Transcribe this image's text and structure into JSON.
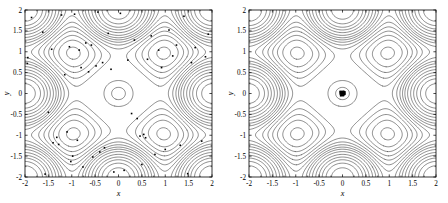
{
  "figure": {
    "panel_count": 2,
    "background_color": "#ffffff",
    "line_color": "#000000",
    "marker_color": "#000000"
  },
  "chart_data": [
    {
      "type": "line",
      "subtype": "contour",
      "panel": "left",
      "title": "",
      "xlabel": "x",
      "ylabel": "y",
      "xlim": [
        -2,
        2
      ],
      "ylim": [
        -2,
        2
      ],
      "xticks": [
        -2,
        -1.5,
        -1,
        -0.5,
        0,
        0.5,
        1,
        1.5,
        2
      ],
      "xticklabels": [
        "-2",
        "-1.5",
        "-1",
        "-0.5",
        "0",
        "0.5",
        "1",
        "1.5",
        "2"
      ],
      "yticks": [
        -2,
        -1.5,
        -1,
        -0.5,
        0,
        0.5,
        1,
        1.5,
        2
      ],
      "yticklabels": [
        "-2",
        "-1.5",
        "-1",
        "-0.5",
        "0",
        "0.5",
        "1",
        "1.5",
        "2"
      ],
      "grid": false,
      "legend": null,
      "contour_levels": 22,
      "field_description": "periodic square-lattice potential with deep central well at origin and secondary wells at integer lattice sites",
      "overlay": {
        "type": "scatter",
        "name": "particles",
        "marker": "square",
        "marker_size": 1.6,
        "count": 60,
        "distribution": "scattered / delocalized across the whole domain",
        "points": [
          [
            -1.94,
            0.86
          ],
          [
            -1.95,
            0.72
          ],
          [
            -1.86,
            1.82
          ],
          [
            -1.57,
            -1.93
          ],
          [
            -1.62,
            1.47
          ],
          [
            -1.5,
            -0.45
          ],
          [
            -1.43,
            1.06
          ],
          [
            -1.4,
            -1.18
          ],
          [
            -1.32,
            -1.05
          ],
          [
            -1.28,
            -1.22
          ],
          [
            -1.22,
            1.88
          ],
          [
            -1.15,
            0.45
          ],
          [
            -1.1,
            -0.92
          ],
          [
            -1.05,
            1.12
          ],
          [
            -1.02,
            -1.63
          ],
          [
            -0.98,
            -1.5
          ],
          [
            -0.94,
            1.9
          ],
          [
            -0.88,
            -1.12
          ],
          [
            -0.84,
            1.04
          ],
          [
            -0.8,
            0.62
          ],
          [
            -0.76,
            -1.76
          ],
          [
            -0.7,
            1.21
          ],
          [
            -0.64,
            0.52
          ],
          [
            -0.58,
            1.16
          ],
          [
            -0.55,
            -1.52
          ],
          [
            -0.48,
            0.66
          ],
          [
            -0.44,
            1.95
          ],
          [
            -0.4,
            -1.4
          ],
          [
            -0.34,
            0.74
          ],
          [
            -0.3,
            -1.3
          ],
          [
            -0.22,
            1.44
          ],
          [
            -0.16,
            0.58
          ],
          [
            -0.1,
            -1.88
          ],
          [
            0.04,
            1.92
          ],
          [
            0.12,
            -1.84
          ],
          [
            0.2,
            0.8
          ],
          [
            0.28,
            -0.48
          ],
          [
            0.34,
            1.28
          ],
          [
            0.4,
            -0.6
          ],
          [
            0.46,
            -1.02
          ],
          [
            0.5,
            -1.7
          ],
          [
            0.54,
            -0.98
          ],
          [
            0.58,
            -1.06
          ],
          [
            0.62,
            0.82
          ],
          [
            0.7,
            1.38
          ],
          [
            0.78,
            -1.46
          ],
          [
            0.86,
            1.04
          ],
          [
            0.92,
            0.62
          ],
          [
            1.0,
            -1.34
          ],
          [
            1.08,
            1.52
          ],
          [
            1.16,
            0.9
          ],
          [
            1.24,
            1.16
          ],
          [
            1.32,
            -1.24
          ],
          [
            1.4,
            1.85
          ],
          [
            1.48,
            -1.92
          ],
          [
            1.56,
            0.74
          ],
          [
            1.64,
            1.1
          ],
          [
            1.78,
            -1.14
          ],
          [
            1.86,
            0.88
          ],
          [
            1.92,
            1.42
          ]
        ]
      }
    },
    {
      "type": "line",
      "subtype": "contour",
      "panel": "right",
      "title": "",
      "xlabel": "x",
      "ylabel": "y",
      "xlim": [
        -2,
        2
      ],
      "ylim": [
        -2,
        2
      ],
      "xticks": [
        -2,
        -1.5,
        -1,
        -0.5,
        0,
        0.5,
        1,
        1.5,
        2
      ],
      "xticklabels": [
        "-2",
        "-1.5",
        "-1",
        "-0.5",
        "0",
        "0.5",
        "1",
        "1.5",
        "2"
      ],
      "yticks": [
        -2,
        -1.5,
        -1,
        -0.5,
        0,
        0.5,
        1,
        1.5,
        2
      ],
      "yticklabels": [
        "-2",
        "-1.5",
        "-1",
        "-0.5",
        "0",
        "0.5",
        "1",
        "1.5",
        "2"
      ],
      "grid": false,
      "legend": null,
      "contour_levels": 22,
      "field_description": "periodic square-lattice potential with deep central well at origin and secondary wells at integer lattice sites",
      "overlay": {
        "type": "scatter",
        "name": "particles",
        "marker": "square",
        "marker_size": 1.6,
        "count": 60,
        "distribution": "collapsed into a single dense cluster at the origin",
        "points": [
          [
            -0.05,
            0.03
          ],
          [
            -0.03,
            -0.02
          ],
          [
            -0.02,
            0.05
          ],
          [
            0.0,
            0.0
          ],
          [
            0.01,
            -0.04
          ],
          [
            0.03,
            0.02
          ],
          [
            0.04,
            -0.01
          ],
          [
            0.05,
            0.04
          ],
          [
            -0.04,
            -0.05
          ],
          [
            0.02,
            0.01
          ],
          [
            -0.01,
            0.04
          ],
          [
            0.04,
            0.03
          ],
          [
            -0.05,
            -0.01
          ],
          [
            0.0,
            -0.05
          ],
          [
            0.03,
            -0.03
          ],
          [
            -0.02,
            0.0
          ],
          [
            0.05,
            -0.02
          ],
          [
            -0.03,
            0.03
          ],
          [
            0.01,
            0.05
          ],
          [
            -0.04,
            0.01
          ],
          [
            0.02,
            -0.05
          ],
          [
            -0.01,
            -0.03
          ],
          [
            0.04,
            0.0
          ],
          [
            -0.05,
            0.05
          ],
          [
            0.0,
            0.02
          ],
          [
            0.03,
            0.05
          ],
          [
            -0.02,
            -0.04
          ],
          [
            0.05,
            0.01
          ],
          [
            -0.03,
            -0.05
          ],
          [
            0.01,
            0.03
          ]
        ]
      }
    }
  ],
  "left_panel": {
    "name": "contour-plot-left",
    "xlabel": "x",
    "ylabel": "y"
  },
  "right_panel": {
    "name": "contour-plot-right",
    "xlabel": "x",
    "ylabel": "y"
  }
}
